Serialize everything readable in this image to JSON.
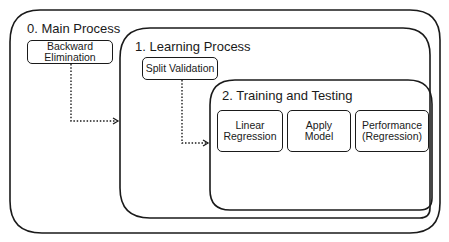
{
  "diagram": {
    "containers": [
      {
        "id": "main",
        "title": "0. Main Process"
      },
      {
        "id": "learning",
        "title": "1. Learning Process"
      },
      {
        "id": "training",
        "title": "2. Training and Testing"
      }
    ],
    "operators": {
      "backward_elimination": {
        "line1": "Backward",
        "line2": "Elimination"
      },
      "split_validation": {
        "line1": "Split Validation"
      },
      "linear_regression": {
        "line1": "Linear",
        "line2": "Regression"
      },
      "apply_model": {
        "line1": "Apply",
        "line2": "Model"
      },
      "performance": {
        "line1": "Performance",
        "line2": "(Regression)"
      }
    },
    "connections": [
      {
        "from": "Backward Elimination",
        "to": "1. Learning Process",
        "style": "dotted-arrow"
      },
      {
        "from": "Split Validation",
        "to": "2. Training and Testing",
        "style": "dotted-arrow"
      }
    ],
    "colors": {
      "stroke": "#1a1a1a",
      "background": "#ffffff"
    }
  }
}
